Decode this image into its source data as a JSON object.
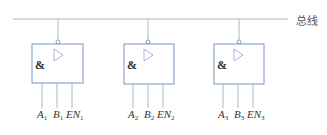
{
  "bus": {
    "label": "总线",
    "y": 19,
    "x_start": 13,
    "x_end": 288,
    "color": "#a8b8c8"
  },
  "colors": {
    "box_stroke": "#7b93c6",
    "lead_stroke": "#a8b8c8",
    "triangle_stroke": "#9aaad0",
    "text": "#333333"
  },
  "gates": [
    {
      "id": 1,
      "symbol": "&",
      "buffer": "tri-state buffer",
      "pins": [
        {
          "name": "A",
          "sub": "1"
        },
        {
          "name": "B",
          "sub": "1"
        },
        {
          "name": "EN",
          "sub": "1"
        }
      ]
    },
    {
      "id": 2,
      "symbol": "&",
      "buffer": "tri-state buffer",
      "pins": [
        {
          "name": "A",
          "sub": "2"
        },
        {
          "name": "B",
          "sub": "2"
        },
        {
          "name": "EN",
          "sub": "2"
        }
      ]
    },
    {
      "id": 3,
      "symbol": "&",
      "buffer": "tri-state buffer",
      "pins": [
        {
          "name": "A",
          "sub": "3"
        },
        {
          "name": "B",
          "sub": "3"
        },
        {
          "name": "EN",
          "sub": "3"
        }
      ]
    }
  ]
}
